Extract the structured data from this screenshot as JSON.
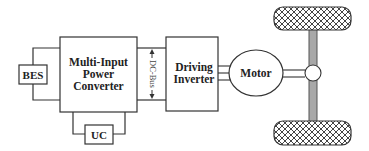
{
  "diagram": {
    "type": "EV powertrain block diagram",
    "nodes": {
      "bes": {
        "label": "BES"
      },
      "converter": {
        "label_lines": [
          "Multi-Input",
          "Power",
          "Converter"
        ]
      },
      "uc": {
        "label": "UC"
      },
      "dc_bus": {
        "label": "DC-Bus"
      },
      "inverter": {
        "label_lines": [
          "Driving",
          "Inverter"
        ]
      },
      "motor": {
        "label": "Motor"
      },
      "wheels": {
        "count": 2,
        "pattern": "crosshatch"
      },
      "axle": {
        "color": "#a8a8a8"
      }
    },
    "edges": [
      {
        "from": "BES",
        "to": "Multi-Input Power Converter"
      },
      {
        "from": "UC",
        "to": "Multi-Input Power Converter"
      },
      {
        "from": "Multi-Input Power Converter",
        "to": "Driving Inverter",
        "via": "DC-Bus"
      },
      {
        "from": "Driving Inverter",
        "to": "Motor",
        "wires": 3
      },
      {
        "from": "Motor",
        "to": "Axle"
      }
    ],
    "colors": {
      "line": "#333333",
      "axle": "#a8a8a8",
      "background": "#ffffff"
    }
  }
}
